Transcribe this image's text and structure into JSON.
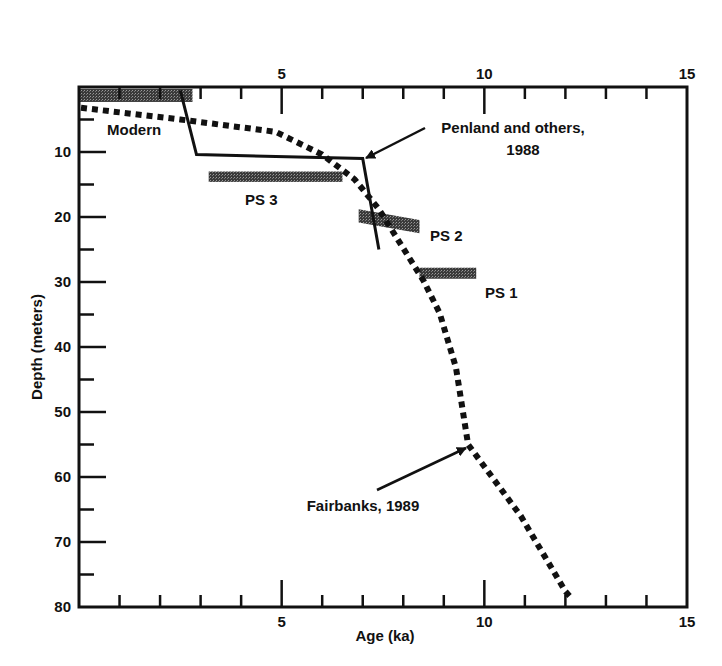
{
  "chart_data": {
    "type": "line",
    "title": "",
    "xlabel": "Age (ka)",
    "ylabel": "Depth (meters)",
    "xlim": [
      0,
      15
    ],
    "ylim": [
      0,
      80
    ],
    "y_inverted": true,
    "x_ticks_major": [
      5,
      10,
      15
    ],
    "x_ticks_minor": [
      1,
      2,
      3,
      4,
      6,
      7,
      8,
      9,
      11,
      12,
      13,
      14
    ],
    "y_ticks_major": [
      10,
      20,
      30,
      40,
      50,
      60,
      70,
      80
    ],
    "y_ticks_minor": [
      5,
      15,
      25,
      35,
      45,
      55,
      65,
      75
    ],
    "x_tick_labels_top": [
      "5",
      "10",
      "15"
    ],
    "x_tick_labels_bottom": [
      "5",
      "10",
      "15"
    ],
    "y_tick_labels": [
      "10",
      "20",
      "30",
      "40",
      "50",
      "60",
      "70",
      "80"
    ],
    "grid": false,
    "series": [
      {
        "name": "Penland and others, 1988",
        "style": "solid",
        "color": "#111111",
        "x": [
          2.5,
          2.9,
          7.0,
          7.4
        ],
        "y": [
          0.5,
          10.4,
          11.0,
          25.0
        ]
      },
      {
        "name": "Fairbanks, 1989",
        "style": "dotted",
        "color": "#111111",
        "x": [
          0.05,
          2.5,
          4.85,
          6.0,
          6.8,
          7.4,
          8.5,
          8.9,
          9.3,
          9.6,
          10.9,
          12.0,
          12.1
        ],
        "y": [
          3.2,
          5.0,
          6.9,
          10.4,
          14.2,
          18.8,
          29.8,
          34.8,
          43.2,
          55.0,
          66.0,
          77.6,
          78.3
        ]
      }
    ],
    "bars": [
      {
        "label": "Modern",
        "x_start": 0.0,
        "x_end": 2.8,
        "y_top": 0.3,
        "y_bottom": 2.3
      },
      {
        "label": "PS 3",
        "x_start": 3.2,
        "x_end": 6.5,
        "y_top": 13.0,
        "y_bottom": 14.6
      },
      {
        "label": "PS 2",
        "x_start": 6.9,
        "x_end": 8.4,
        "y_top": 18.8,
        "y_bottom": 22.5,
        "slanted": true
      },
      {
        "label": "PS 1",
        "x_start": 8.4,
        "x_end": 9.8,
        "y_top": 27.8,
        "y_bottom": 29.5
      }
    ],
    "annotations": [
      {
        "text": "Penland and others,",
        "text2": "1988",
        "arrow_to": [
          7.0,
          11.0
        ]
      },
      {
        "text": "Fairbanks, 1989",
        "arrow_to": [
          9.6,
          55.0
        ]
      },
      {
        "text": "Modern"
      },
      {
        "text": "PS 3"
      },
      {
        "text": "PS 2"
      },
      {
        "text": "PS 1"
      }
    ]
  },
  "labels": {
    "xlabel": "Age (ka)",
    "ylabel": "Depth (meters)",
    "penland_line1": "Penland and others,",
    "penland_line2": "1988",
    "fairbanks": "Fairbanks, 1989",
    "modern": "Modern",
    "ps3": "PS 3",
    "ps2": "PS 2",
    "ps1": "PS 1"
  }
}
